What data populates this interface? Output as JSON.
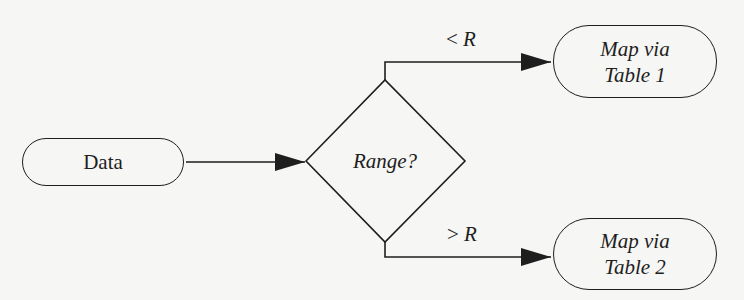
{
  "diagram": {
    "type": "flowchart",
    "colors": {
      "stroke": "#1e1e1e",
      "background": "#f6f6f4"
    },
    "nodes": {
      "data": {
        "label": "Data",
        "shape": "rounded-rectangle"
      },
      "decision": {
        "label": "Range?",
        "shape": "diamond"
      },
      "table1": {
        "line1": "Map via",
        "line2": "Table 1",
        "shape": "rounded-rectangle"
      },
      "table2": {
        "line1": "Map via",
        "line2": "Table 2",
        "shape": "rounded-rectangle"
      }
    },
    "edges": {
      "data_to_decision": {
        "from": "Data",
        "to": "Range?",
        "label": ""
      },
      "decision_to_table1": {
        "from": "Range?",
        "to": "Map via Table 1",
        "op": "<",
        "var": "R"
      },
      "decision_to_table2": {
        "from": "Range?",
        "to": "Map via Table 2",
        "op": ">",
        "var": "R"
      }
    }
  }
}
